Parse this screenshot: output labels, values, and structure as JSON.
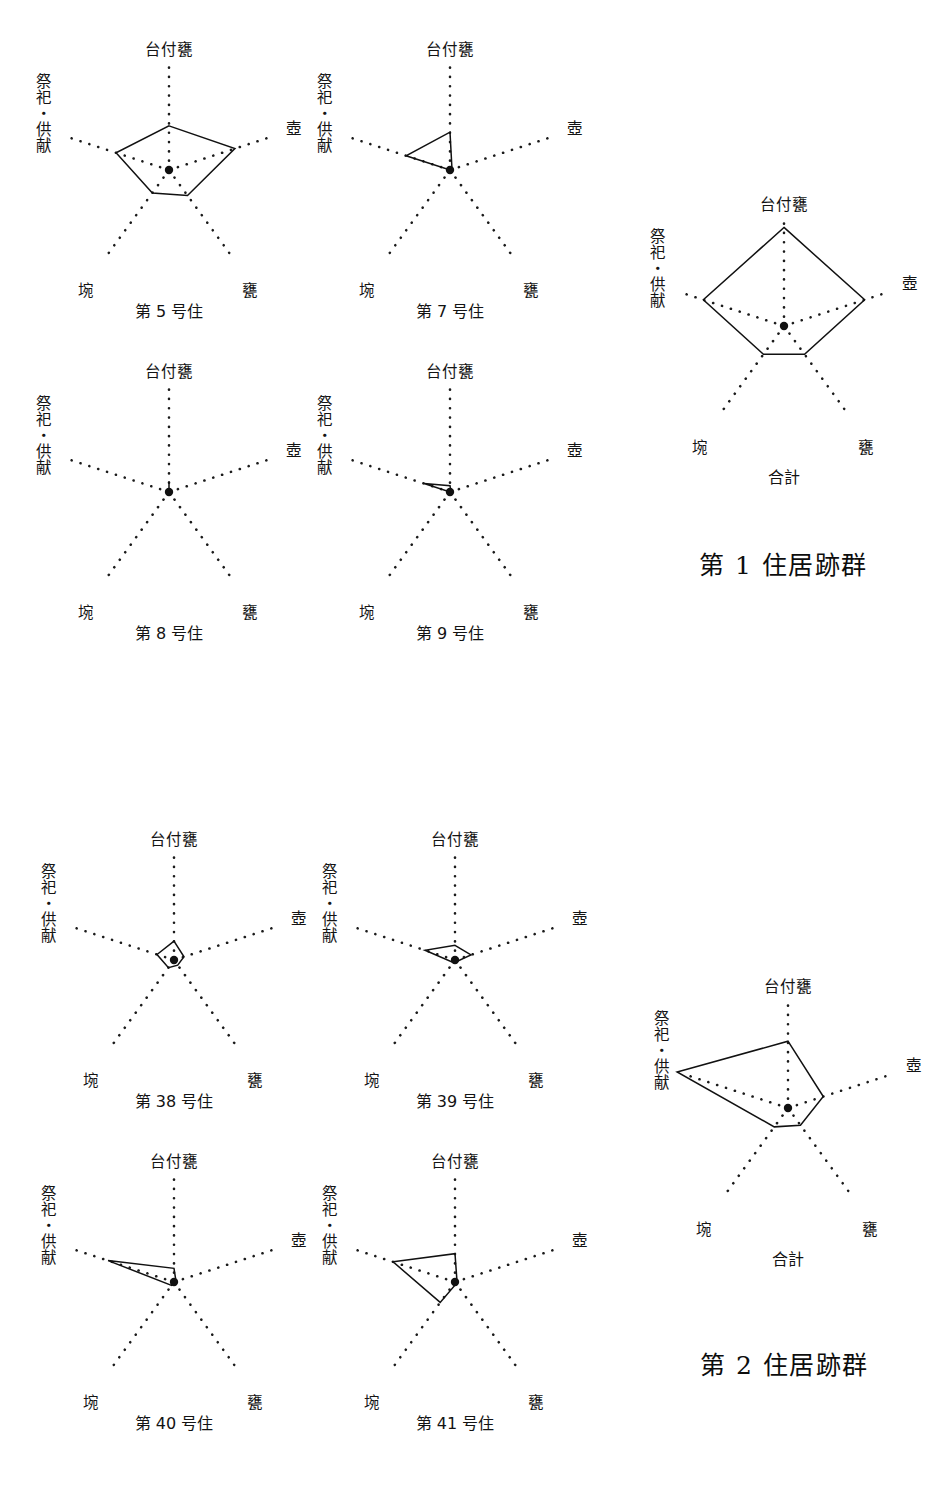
{
  "figure": {
    "type": "radar-chart-grid",
    "background_color": "#ffffff",
    "line_color": "#111111",
    "axis_style": "dotted"
  },
  "axes": {
    "labels": {
      "top": "台付甕",
      "upper_right": "壺",
      "lower_right": "甕",
      "lower_left": "埦",
      "upper_left": "祭祀・供献"
    },
    "order": [
      "台付甕",
      "壺",
      "甕",
      "埦",
      "祭祀・供献"
    ]
  },
  "groups": [
    {
      "title": "第 1 住居跡群",
      "charts": [
        {
          "caption": "第 5 号住",
          "values": [
            0.42,
            0.66,
            0.3,
            0.27,
            0.53
          ]
        },
        {
          "caption": "第 7 号住",
          "values": [
            0.36,
            0.02,
            0.0,
            0.0,
            0.44
          ]
        },
        {
          "caption": "第 8 号住",
          "values": [
            0.1,
            0.0,
            0.0,
            0.0,
            0.0
          ]
        },
        {
          "caption": "第 9 号住",
          "values": [
            0.06,
            0.01,
            0.0,
            0.0,
            0.26
          ]
        }
      ],
      "total": {
        "caption": "合計",
        "values": [
          0.93,
          0.8,
          0.33,
          0.33,
          0.8
        ]
      }
    },
    {
      "title": "第 2 住居跡群",
      "charts": [
        {
          "caption": "第 38 号住",
          "values": [
            0.18,
            0.1,
            0.06,
            0.09,
            0.17
          ]
        },
        {
          "caption": "第 39 号住",
          "values": [
            0.14,
            0.16,
            0.02,
            0.03,
            0.3
          ]
        },
        {
          "caption": "第 40 号住",
          "values": [
            0.13,
            0.02,
            0.0,
            0.04,
            0.66
          ]
        },
        {
          "caption": "第 41 号住",
          "values": [
            0.27,
            0.02,
            0.02,
            0.24,
            0.62
          ]
        }
      ],
      "total": {
        "caption": "合計",
        "values": [
          0.63,
          0.35,
          0.2,
          0.22,
          1.1
        ]
      }
    }
  ],
  "chart_data": {
    "type": "radar",
    "title": "",
    "categories": [
      "台付甕",
      "壺",
      "甕",
      "埦",
      "祭祀・供献"
    ],
    "rlim": [
      0,
      1
    ],
    "grid": false,
    "legend": "none",
    "axis_label_positions": {
      "台付甕": "top",
      "壺": "upper-right",
      "甕": "lower-right",
      "埦": "lower-left",
      "祭祀・供献": "upper-left (vertical text)"
    },
    "panels": [
      {
        "group": "第 1 住居跡群",
        "name": "第 5 号住",
        "values": [
          0.42,
          0.66,
          0.3,
          0.27,
          0.53
        ]
      },
      {
        "group": "第 1 住居跡群",
        "name": "第 7 号住",
        "values": [
          0.36,
          0.02,
          0.0,
          0.0,
          0.44
        ]
      },
      {
        "group": "第 1 住居跡群",
        "name": "第 8 号住",
        "values": [
          0.1,
          0.0,
          0.0,
          0.0,
          0.0
        ]
      },
      {
        "group": "第 1 住居跡群",
        "name": "第 9 号住",
        "values": [
          0.06,
          0.01,
          0.0,
          0.0,
          0.26
        ]
      },
      {
        "group": "第 1 住居跡群",
        "name": "合計",
        "values": [
          0.93,
          0.8,
          0.33,
          0.33,
          0.8
        ]
      },
      {
        "group": "第 2 住居跡群",
        "name": "第 38 号住",
        "values": [
          0.18,
          0.1,
          0.06,
          0.09,
          0.17
        ]
      },
      {
        "group": "第 2 住居跡群",
        "name": "第 39 号住",
        "values": [
          0.14,
          0.16,
          0.02,
          0.03,
          0.3
        ]
      },
      {
        "group": "第 2 住居跡群",
        "name": "第 40 号住",
        "values": [
          0.13,
          0.02,
          0.0,
          0.04,
          0.66
        ]
      },
      {
        "group": "第 2 住居跡群",
        "name": "第 41 号住",
        "values": [
          0.27,
          0.02,
          0.02,
          0.24,
          0.62
        ]
      },
      {
        "group": "第 2 住居跡群",
        "name": "合計",
        "values": [
          0.63,
          0.35,
          0.2,
          0.22,
          1.1
        ]
      }
    ]
  }
}
